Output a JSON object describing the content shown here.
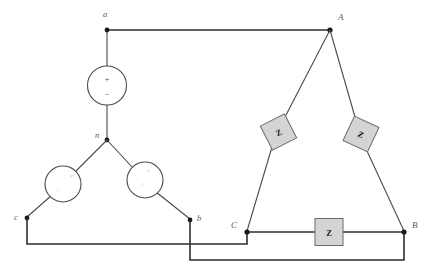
{
  "diagram": {
    "source_side": {
      "nodes": [
        {
          "id": "a",
          "label": "a"
        },
        {
          "id": "b",
          "label": "b"
        },
        {
          "id": "c",
          "label": "c"
        },
        {
          "id": "n",
          "label": "n"
        }
      ],
      "sources": [
        {
          "id": "source-an",
          "plus": "+",
          "minus": "−"
        },
        {
          "id": "source-cn",
          "plus": "+",
          "minus": "−"
        },
        {
          "id": "source-bn",
          "plus": "+",
          "minus": "−"
        }
      ]
    },
    "load_side": {
      "nodes": [
        {
          "id": "A",
          "label": "A"
        },
        {
          "id": "B",
          "label": "B"
        },
        {
          "id": "C",
          "label": "C"
        }
      ],
      "impedances": [
        {
          "id": "z-ca",
          "label": "Z"
        },
        {
          "id": "z-ab",
          "label": "Z"
        },
        {
          "id": "z-cb",
          "label": "Z"
        }
      ]
    },
    "colors": {
      "wire": "#3a3a3a",
      "impedance_fill": "#d4d4d4",
      "impedance_stroke": "#6a6a6a",
      "label": "#5a5a5a",
      "node_dot": "#1a1a1a",
      "background": "#ffffff"
    }
  }
}
